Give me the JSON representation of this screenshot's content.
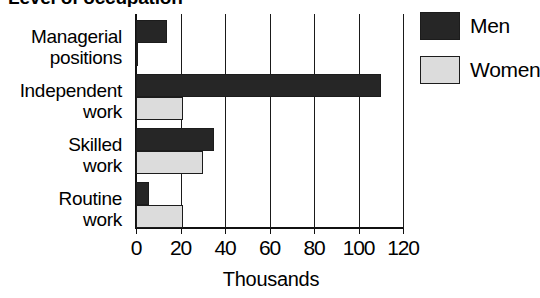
{
  "chart_data": {
    "type": "bar",
    "orientation": "horizontal",
    "title": "Level of occupation",
    "title_cropped": true,
    "categories": [
      "Managerial positions",
      "Independent work",
      "Skilled work",
      "Routine work"
    ],
    "category_lines": [
      [
        "Managerial",
        "positions"
      ],
      [
        "Independent",
        "work"
      ],
      [
        "Skilled",
        "work"
      ],
      [
        "Routine",
        "work"
      ]
    ],
    "series": [
      {
        "name": "Men",
        "color": "#262626",
        "values": [
          14,
          110,
          35,
          6
        ]
      },
      {
        "name": "Women",
        "color": "#dcdcdc",
        "values": [
          1,
          21,
          30,
          21
        ]
      }
    ],
    "xlabel": "Thousands",
    "ylabel": "",
    "xlim": [
      0,
      120
    ],
    "xticks": [
      0,
      20,
      40,
      60,
      80,
      100,
      120
    ],
    "xtick_labels": [
      "0",
      "20",
      "40",
      "60",
      "80",
      "100",
      "120"
    ],
    "grid": "vertical",
    "legend_position": "right-top",
    "units": "thousands"
  },
  "legend": {
    "items": [
      {
        "label": "Men"
      },
      {
        "label": "Women"
      }
    ]
  },
  "axis": {
    "x_caption": "Thousands"
  }
}
